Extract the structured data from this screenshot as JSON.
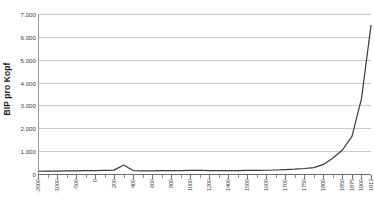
{
  "chart_data": {
    "type": "line",
    "title": "",
    "xlabel": "",
    "ylabel": "BIP pro Kopf",
    "ylim": [
      0,
      7000
    ],
    "ytick_labels": [
      "0",
      "1.000",
      "2.000",
      "3.000",
      "4.000",
      "5.000",
      "6.000",
      "7.000"
    ],
    "ytick_values": [
      0,
      1000,
      2000,
      3000,
      4000,
      5000,
      6000,
      7000
    ],
    "xtick_labels": [
      "-2000",
      "-1000",
      "-500",
      "0",
      "200",
      "400",
      "600",
      "800",
      "1000",
      "1200",
      "1400",
      "1500",
      "1600",
      "1700",
      "1750",
      "1800",
      "1850",
      "1875",
      "1900",
      "1913",
      "1950",
      "1973"
    ],
    "grid": true,
    "legend": "none",
    "line_color": "#3a3a3a",
    "grid_color": "#c9c9c9",
    "axis_color": "#6e6e6e",
    "background": "#ffffff",
    "x": [
      0,
      1,
      2,
      3,
      4,
      5,
      6,
      7,
      8,
      9,
      10,
      11,
      12,
      13,
      14,
      15,
      16,
      17,
      18,
      19,
      20,
      21,
      22,
      23,
      24,
      25,
      26,
      27,
      28,
      29,
      30,
      31,
      32,
      33,
      34,
      35
    ],
    "x_labels_at": [
      0,
      2,
      4,
      6,
      8,
      10,
      12,
      14,
      16,
      18,
      20,
      22,
      24,
      26,
      28,
      30,
      32,
      33,
      34,
      35
    ],
    "values": [
      120,
      125,
      130,
      135,
      140,
      145,
      150,
      160,
      170,
      390,
      150,
      140,
      140,
      145,
      145,
      150,
      155,
      155,
      150,
      150,
      148,
      150,
      155,
      160,
      165,
      175,
      190,
      210,
      240,
      280,
      420,
      700,
      1050,
      1650,
      3300,
      6500
    ],
    "series_name": "BIP pro Kopf",
    "peak_value": 6500,
    "peak_label": "1973",
    "bump_value": 390,
    "bump_label": "200",
    "baseline_value": 130
  },
  "y_axis": {
    "title": "BIP pro Kopf"
  },
  "x_axis": {
    "title": ""
  }
}
